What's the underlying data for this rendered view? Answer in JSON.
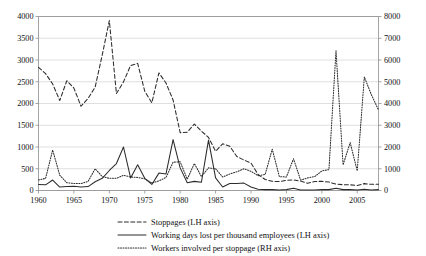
{
  "chart_data": {
    "type": "line",
    "title": "",
    "subtitle": "",
    "xlabel": "",
    "ylabel": "",
    "grid": true,
    "legend_position": "bottom",
    "x": [
      1960,
      1961,
      1962,
      1963,
      1964,
      1965,
      1966,
      1967,
      1968,
      1969,
      1970,
      1971,
      1972,
      1973,
      1974,
      1975,
      1976,
      1977,
      1978,
      1979,
      1980,
      1981,
      1982,
      1983,
      1984,
      1985,
      1986,
      1987,
      1988,
      1989,
      1990,
      1991,
      1992,
      1993,
      1994,
      1995,
      1996,
      1997,
      1998,
      1999,
      2000,
      2001,
      2002,
      2003,
      2004,
      2005,
      2006,
      2007,
      2008
    ],
    "xlim": [
      1960,
      2008
    ],
    "xticks": [
      1960,
      1965,
      1970,
      1975,
      1980,
      1985,
      1990,
      1995,
      2000,
      2005
    ],
    "xticklabels": [
      "1960",
      "1965",
      "1970",
      "1975",
      "1980",
      "1985",
      "1990",
      "1995",
      "2000",
      "2005"
    ],
    "left_axis": {
      "label": "",
      "ylim": [
        0,
        4000
      ],
      "yticks": [
        0,
        500,
        1000,
        1500,
        2000,
        2500,
        3000,
        3500,
        4000
      ],
      "yticklabels": [
        "0",
        "500",
        "1000",
        "1500",
        "2000",
        "2500",
        "3000",
        "3500",
        "4000"
      ]
    },
    "right_axis": {
      "label": "",
      "ylim": [
        0,
        8000
      ],
      "yticks": [
        0,
        1000,
        2000,
        3000,
        4000,
        5000,
        6000,
        7000,
        8000
      ],
      "yticklabels": [
        "0",
        "1000",
        "2000",
        "3000",
        "4000",
        "5000",
        "6000",
        "7000",
        "8000"
      ]
    },
    "series": [
      {
        "name": "Stoppages (LH axis)",
        "axis": "left",
        "style": "dashed",
        "color": "#2b2b2b",
        "values": [
          2832,
          2686,
          2449,
          2068,
          2524,
          2354,
          1937,
          2116,
          2378,
          3116,
          3906,
          2228,
          2497,
          2873,
          2922,
          2282,
          2016,
          2703,
          2471,
          2080,
          1330,
          1338,
          1528,
          1364,
          1221,
          903,
          1074,
          1016,
          781,
          701,
          630,
          369,
          253,
          211,
          205,
          235,
          244,
          216,
          166,
          205,
          212,
          194,
          146,
          133,
          130,
          116,
          158,
          142,
          144
        ]
      },
      {
        "name": "Working days lost per thousand employees (LH axis)",
        "axis": "left",
        "style": "solid",
        "color": "#2b2b2b",
        "values": [
          140,
          130,
          240,
          80,
          90,
          100,
          80,
          90,
          200,
          280,
          460,
          620,
          1000,
          290,
          590,
          280,
          140,
          400,
          380,
          1170,
          520,
          180,
          210,
          190,
          1160,
          290,
          80,
          160,
          160,
          170,
          80,
          30,
          20,
          20,
          10,
          20,
          50,
          10,
          10,
          10,
          20,
          20,
          50,
          20,
          20,
          10,
          30,
          10,
          20
        ]
      },
      {
        "name": "Workers involved per stoppage (RH axis)",
        "axis": "right",
        "style": "dotted",
        "color": "#2b2b2b",
        "values": [
          480,
          560,
          1860,
          700,
          360,
          320,
          320,
          420,
          1000,
          640,
          560,
          560,
          700,
          620,
          600,
          540,
          340,
          440,
          600,
          1300,
          1320,
          520,
          1240,
          640,
          1040,
          1000,
          620,
          760,
          860,
          1000,
          880,
          680,
          740,
          1900,
          640,
          620,
          1460,
          480,
          580,
          640,
          900,
          960,
          6420,
          1180,
          2200,
          900,
          5220,
          4400,
          3700
        ]
      }
    ]
  },
  "legend": {
    "items": [
      {
        "label": "Stoppages (LH axis)",
        "style": "dashed"
      },
      {
        "label": "Working days lost per thousand employees (LH axis)",
        "style": "solid"
      },
      {
        "label": "Workers involved per stoppage (RH axis)",
        "style": "dotted"
      }
    ]
  }
}
